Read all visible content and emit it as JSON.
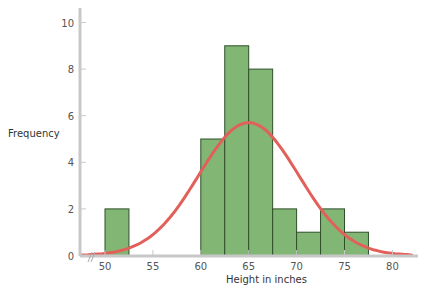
{
  "chart_data": {
    "type": "bar",
    "subtype": "histogram_with_normal_curve",
    "title": "",
    "xlabel": "Height in inches",
    "ylabel": "Frequency",
    "xlim": [
      47.5,
      83
    ],
    "ylim": [
      0,
      10.5
    ],
    "x_ticks": [
      50,
      55,
      60,
      65,
      70,
      75,
      80
    ],
    "y_ticks": [
      0,
      2,
      4,
      6,
      8,
      10
    ],
    "grid": false,
    "axis_break_on_x": true,
    "bin_width": 2.5,
    "bins": [
      {
        "start": 50,
        "end": 52.5,
        "count": 2
      },
      {
        "start": 60,
        "end": 62.5,
        "count": 5
      },
      {
        "start": 62.5,
        "end": 65,
        "count": 9
      },
      {
        "start": 65,
        "end": 67.5,
        "count": 8
      },
      {
        "start": 67.5,
        "end": 70,
        "count": 2
      },
      {
        "start": 70,
        "end": 72.5,
        "count": 1
      },
      {
        "start": 72.5,
        "end": 75,
        "count": 2
      },
      {
        "start": 75,
        "end": 77.5,
        "count": 1
      }
    ],
    "categories": [
      "50-52.5",
      "60-62.5",
      "62.5-65",
      "65-67.5",
      "67.5-70",
      "70-72.5",
      "72.5-75",
      "75-77.5"
    ],
    "values": [
      2,
      5,
      9,
      8,
      2,
      1,
      2,
      1
    ],
    "normal_curve": {
      "mean": 65,
      "sd": 5.2,
      "peak": 5.7,
      "x_range": [
        47.5,
        82
      ],
      "color": "#e2605a"
    },
    "bar_color": "#82b675",
    "bar_edge_color": "#2f4f2a",
    "axis_color": "#c8c8c8"
  },
  "labels": {
    "y_axis_title": "Frequency",
    "x_axis_title": "Height in inches",
    "x_ticks": [
      "50",
      "55",
      "60",
      "65",
      "70",
      "75",
      "80"
    ],
    "y_ticks": [
      "0",
      "2",
      "4",
      "6",
      "8",
      "10"
    ]
  }
}
